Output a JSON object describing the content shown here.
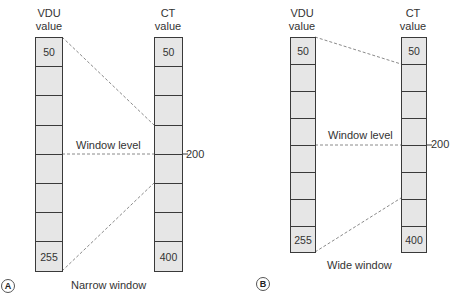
{
  "panels": [
    {
      "id": "A",
      "badge": "A",
      "caption": "Narrow window",
      "vdu_header": [
        "VDU",
        "value"
      ],
      "ct_header": [
        "CT",
        "value"
      ],
      "vdu_cells": [
        "50",
        "",
        "",
        "",
        "",
        "",
        "",
        "255"
      ],
      "ct_cells": [
        "50",
        "",
        "",
        "",
        "",
        "",
        "",
        "400"
      ],
      "window_level_label": "Window level",
      "window_level_value": "200"
    },
    {
      "id": "B",
      "badge": "B",
      "caption": "Wide window",
      "vdu_header": [
        "VDU",
        "value"
      ],
      "ct_header": [
        "CT",
        "value"
      ],
      "vdu_cells": [
        "50",
        "",
        "",
        "",
        "",
        "",
        "",
        "255"
      ],
      "ct_cells": [
        "50",
        "",
        "",
        "",
        "",
        "",
        "",
        "400"
      ],
      "window_level_label": "Window level",
      "window_level_value": "200"
    }
  ],
  "colors": {
    "cell_fill": "#e6e6e6",
    "border": "#3a3a3a",
    "dashed_line": "#8a8a8a",
    "text": "#333333"
  }
}
